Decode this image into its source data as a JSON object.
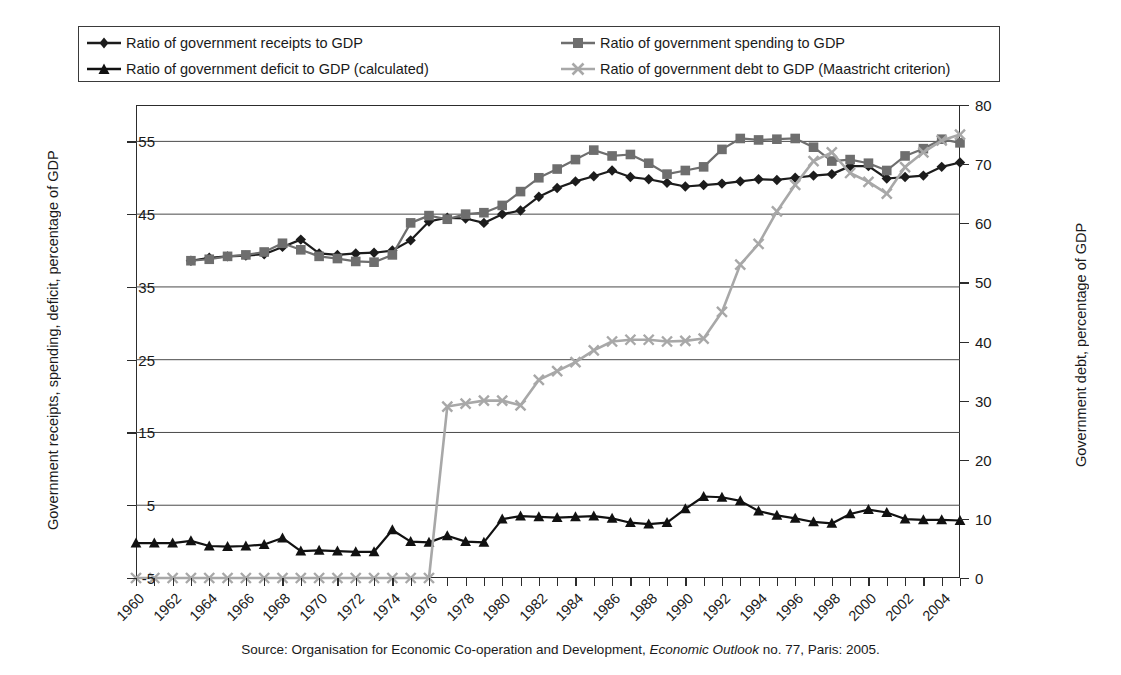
{
  "legend": {
    "items": [
      {
        "label": "Ratio of government receipts to GDP",
        "marker": "diamond-marker",
        "color": "#1c1c1c"
      },
      {
        "label": "Ratio of government spending to GDP",
        "marker": "square-marker",
        "color": "#6e6e6e"
      },
      {
        "label": "Ratio of government deficit to GDP (calculated)",
        "marker": "triangle-marker",
        "color": "#111111"
      },
      {
        "label": "Ratio of government debt to GDP (Maastricht criterion)",
        "marker": "x-marker",
        "color": "#a8a8a8"
      }
    ]
  },
  "axes": {
    "left_title": "Government receipts, spending, deficit, percentage of GDP",
    "right_title": "Government debt, percentage of GDP",
    "left_ticks": [
      "-5",
      "5",
      "15",
      "25",
      "35",
      "45",
      "55"
    ],
    "right_ticks": [
      "0",
      "10",
      "20",
      "30",
      "40",
      "50",
      "60",
      "70",
      "80"
    ],
    "x_ticks": [
      "1960",
      "1962",
      "1964",
      "1966",
      "1968",
      "1970",
      "1972",
      "1974",
      "1976",
      "1978",
      "1980",
      "1982",
      "1984",
      "1986",
      "1988",
      "1990",
      "1992",
      "1994",
      "1996",
      "1998",
      "2000",
      "2002",
      "2004"
    ]
  },
  "source": {
    "prefix": "Source: Organisation for Economic Co-operation and Development, ",
    "italic": "Economic Outlook",
    "suffix": " no. 77, Paris: 2005."
  },
  "chart_data": {
    "type": "line",
    "title": "",
    "xlabel": "",
    "ylabel": "Government receipts, spending, deficit, percentage of GDP",
    "ylabel_right": "Government debt, percentage of GDP",
    "grid": true,
    "legend_position": "top",
    "xlim": [
      1960,
      2005
    ],
    "ylim": [
      -5,
      60
    ],
    "ylim_right": [
      0,
      80
    ],
    "x": [
      1960,
      1961,
      1962,
      1963,
      1964,
      1965,
      1966,
      1967,
      1968,
      1969,
      1970,
      1971,
      1972,
      1973,
      1974,
      1975,
      1976,
      1977,
      1978,
      1979,
      1980,
      1981,
      1982,
      1983,
      1984,
      1985,
      1986,
      1987,
      1988,
      1989,
      1990,
      1991,
      1992,
      1993,
      1994,
      1995,
      1996,
      1997,
      1998,
      1999,
      2000,
      2001,
      2002,
      2003,
      2004,
      2005
    ],
    "series": [
      {
        "name": "Ratio of government receipts to GDP",
        "axis": "left",
        "marker": "diamond",
        "color": "#1c1c1c",
        "values": [
          null,
          null,
          null,
          38.6,
          39.0,
          39.2,
          39.3,
          39.5,
          40.5,
          41.5,
          39.6,
          39.4,
          39.6,
          39.7,
          40.0,
          41.4,
          44.0,
          44.5,
          44.4,
          43.8,
          45.0,
          45.5,
          47.4,
          48.6,
          49.5,
          50.2,
          51.0,
          50.1,
          49.8,
          49.3,
          48.8,
          49.0,
          49.2,
          49.5,
          49.8,
          49.7,
          50.0,
          50.3,
          50.5,
          51.6,
          51.6,
          49.9,
          50.1,
          50.3,
          51.5,
          52.1
        ]
      },
      {
        "name": "Ratio of government spending to GDP",
        "axis": "left",
        "marker": "square",
        "color": "#6e6e6e",
        "values": [
          null,
          null,
          null,
          38.6,
          38.8,
          39.2,
          39.4,
          39.8,
          41.0,
          40.1,
          39.2,
          38.9,
          38.5,
          38.4,
          39.4,
          43.8,
          44.8,
          44.3,
          45.0,
          45.2,
          46.2,
          48.1,
          50.0,
          51.2,
          52.5,
          53.8,
          53.0,
          53.2,
          52.0,
          50.5,
          51.0,
          51.5,
          53.9,
          55.4,
          55.2,
          55.3,
          55.4,
          54.2,
          52.3,
          52.5,
          52.0,
          51.0,
          53.0,
          54.0,
          55.3,
          54.8
        ]
      },
      {
        "name": "Ratio of government deficit to GDP (calculated)",
        "axis": "left",
        "marker": "triangle",
        "color": "#111111",
        "values": [
          -0.2,
          -0.2,
          -0.2,
          0.1,
          -0.6,
          -0.7,
          -0.6,
          -0.4,
          0.5,
          -1.3,
          -1.2,
          -1.3,
          -1.4,
          -1.4,
          1.6,
          0.0,
          -0.1,
          0.8,
          0.0,
          -0.1,
          3.1,
          3.5,
          3.4,
          3.3,
          3.4,
          3.5,
          3.2,
          2.6,
          2.4,
          2.6,
          4.5,
          6.2,
          6.1,
          5.6,
          4.2,
          3.6,
          3.2,
          2.7,
          2.5,
          3.8,
          4.4,
          4.0,
          3.1,
          3.0,
          3.0,
          2.9
        ]
      },
      {
        "name": "Ratio of government debt to GDP (Maastricht criterion)",
        "axis": "right",
        "marker": "x",
        "color": "#a8a8a8",
        "values": [
          0,
          0,
          0,
          0,
          0,
          0,
          0,
          0,
          0,
          0,
          0,
          0,
          0,
          0,
          0,
          0,
          0,
          29.0,
          29.5,
          30.0,
          30.0,
          29.2,
          33.5,
          35.0,
          36.5,
          38.5,
          40.0,
          40.3,
          40.3,
          40.0,
          40.1,
          40.5,
          45.0,
          53.0,
          56.5,
          62.0,
          66.5,
          70.5,
          72.0,
          68.5,
          67.0,
          65.0,
          69.5,
          72.0,
          74.0,
          75.0
        ]
      }
    ]
  }
}
